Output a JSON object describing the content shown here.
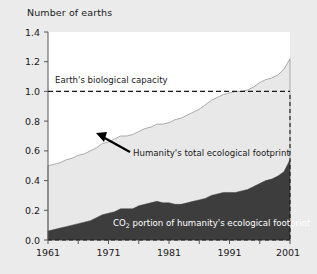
{
  "chart_data": {
    "type": "area",
    "title": "",
    "ylabel": "Number of earths",
    "xlabel": "",
    "ylim": [
      0.0,
      1.4
    ],
    "xlim": [
      1961,
      2001
    ],
    "grid": false,
    "legend": "none",
    "y_ticks": [
      "0.0",
      "0.2",
      "0.4",
      "0.6",
      "0.8",
      "1.0",
      "1.2",
      "1.4"
    ],
    "y_tick_values": [
      0.0,
      0.2,
      0.4,
      0.6,
      0.8,
      1.0,
      1.2,
      1.4
    ],
    "x_ticks": [
      "1961",
      "1971",
      "1981",
      "1991",
      "2001"
    ],
    "x_tick_values": [
      1961,
      1971,
      1981,
      1991,
      2001
    ],
    "x": [
      1961,
      1962,
      1963,
      1964,
      1965,
      1966,
      1967,
      1968,
      1969,
      1970,
      1971,
      1972,
      1973,
      1974,
      1975,
      1976,
      1977,
      1978,
      1979,
      1980,
      1981,
      1982,
      1983,
      1984,
      1985,
      1986,
      1987,
      1988,
      1989,
      1990,
      1991,
      1992,
      1993,
      1994,
      1995,
      1996,
      1997,
      1998,
      1999,
      2000,
      2001
    ],
    "series": [
      {
        "name": "Humanity's total ecological footprint",
        "color": "#e8e8e8",
        "stacked": true,
        "values": [
          0.5,
          0.51,
          0.52,
          0.54,
          0.55,
          0.57,
          0.58,
          0.6,
          0.62,
          0.65,
          0.66,
          0.68,
          0.7,
          0.7,
          0.71,
          0.73,
          0.75,
          0.76,
          0.78,
          0.78,
          0.79,
          0.81,
          0.82,
          0.84,
          0.86,
          0.88,
          0.91,
          0.94,
          0.96,
          0.98,
          0.99,
          1.0,
          1.0,
          1.01,
          1.03,
          1.06,
          1.08,
          1.09,
          1.11,
          1.15,
          1.22
        ]
      },
      {
        "name": "CO2 portion of humanity's ecological footprint",
        "color": "#3d3d3d",
        "stacked": true,
        "values": [
          0.06,
          0.07,
          0.08,
          0.09,
          0.1,
          0.11,
          0.12,
          0.13,
          0.15,
          0.17,
          0.18,
          0.19,
          0.21,
          0.21,
          0.21,
          0.23,
          0.24,
          0.25,
          0.26,
          0.25,
          0.25,
          0.24,
          0.24,
          0.25,
          0.26,
          0.27,
          0.28,
          0.3,
          0.31,
          0.32,
          0.32,
          0.32,
          0.33,
          0.34,
          0.36,
          0.38,
          0.4,
          0.41,
          0.43,
          0.46,
          0.54
        ]
      }
    ],
    "annotations": [
      {
        "name": "biological-capacity-line",
        "text": "Earth's biological capacity",
        "value": 1.0,
        "style": "dashed-horizontal"
      },
      {
        "name": "total-footprint-label",
        "text": "Humanity's total ecological footprint",
        "style": "arrow-callout"
      },
      {
        "name": "co2-portion-label",
        "text_before": "CO",
        "text_sub": "2",
        "text_after": " portion of humanity's ecological footprint",
        "style": "inline-white"
      }
    ]
  },
  "labels": {
    "y_axis_title": "Number of earths",
    "capacity": "Earth's biological capacity",
    "total_footprint": "Humanity's total ecological footprint",
    "co2_prefix": "CO",
    "co2_sub": "2",
    "co2_suffix": " portion of humanity's ecological footprint",
    "y0": "0.0",
    "y1": "0.2",
    "y2": "0.4",
    "y3": "0.6",
    "y4": "0.8",
    "y5": "1.0",
    "y6": "1.2",
    "y7": "1.4",
    "x0": "1961",
    "x1": "1971",
    "x2": "1981",
    "x3": "1991",
    "x4": "2001"
  },
  "colors": {
    "background": "#ebebeb",
    "plot_background": "#ffffff",
    "footprint_fill": "#e8e8e8",
    "co2_fill": "#3d3d3d",
    "axis": "#555555",
    "text": "#1a1a1a"
  }
}
